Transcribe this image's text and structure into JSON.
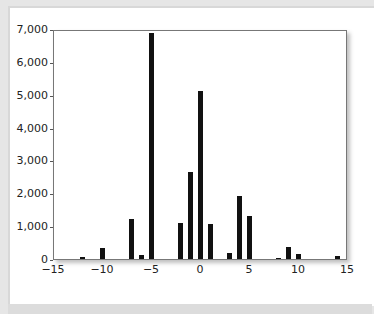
{
  "chart_data": {
    "type": "bar",
    "title": "",
    "xlabel": "",
    "ylabel": "",
    "xlim": [
      -15,
      15
    ],
    "ylim": [
      0,
      7000
    ],
    "grid": false,
    "legend": null,
    "x_ticks": [
      "−15",
      "−10",
      "−5",
      "0",
      "5",
      "10",
      "15"
    ],
    "x_tick_values": [
      -15,
      -10,
      -5,
      0,
      5,
      10,
      15
    ],
    "y_ticks": [
      "0",
      "1,000",
      "2,000",
      "3,000",
      "4,000",
      "5,000",
      "6,000",
      "7,000"
    ],
    "y_tick_values": [
      0,
      1000,
      2000,
      3000,
      4000,
      5000,
      6000,
      7000
    ],
    "x": [
      -12,
      -10,
      -7,
      -6,
      -5,
      -2,
      -1,
      0,
      1,
      3,
      4,
      5,
      8,
      9,
      10,
      14
    ],
    "values": [
      70,
      350,
      1220,
      130,
      6880,
      1090,
      2650,
      5110,
      1060,
      170,
      1930,
      1310,
      20,
      370,
      150,
      90
    ]
  }
}
